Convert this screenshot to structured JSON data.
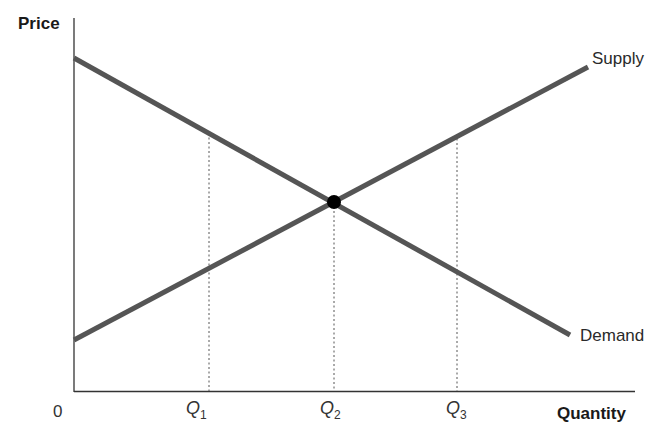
{
  "diagram": {
    "y_axis_label": "Price",
    "x_axis_label": "Quantity",
    "origin_label": "0",
    "curves": [
      {
        "name": "Supply",
        "label": "Supply",
        "slope": "upward"
      },
      {
        "name": "Demand",
        "label": "Demand",
        "slope": "downward"
      }
    ],
    "x_ticks": [
      {
        "base": "Q",
        "sub": "1"
      },
      {
        "base": "Q",
        "sub": "2"
      },
      {
        "base": "Q",
        "sub": "3"
      }
    ],
    "equilibrium": {
      "quantity": "Q2",
      "marker": "filled-circle"
    },
    "colors": {
      "curve": "#555555",
      "axis": "#333333",
      "point": "#000000",
      "guide": "#555555"
    }
  }
}
